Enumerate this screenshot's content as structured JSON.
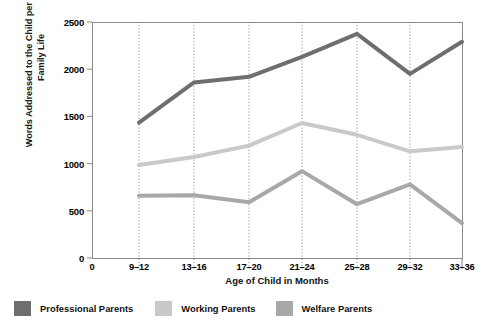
{
  "chart_data": {
    "type": "line",
    "title": "",
    "xlabel": "Age of Child in Months",
    "ylabel": "Words Addressed to the Child per Hour of Family Life",
    "categories": [
      "9–12",
      "13–16",
      "17–20",
      "21–24",
      "25–28",
      "29–32",
      "33–36"
    ],
    "xtick_labels": [
      "0",
      "9–12",
      "13–16",
      "17–20",
      "21–24",
      "25–28",
      "29–32",
      "33–36"
    ],
    "ytick_labels": [
      "0",
      "500",
      "1000",
      "1500",
      "2000",
      "2500"
    ],
    "yticks": [
      0,
      500,
      1000,
      1500,
      2000,
      2500
    ],
    "ylim": [
      0,
      2500
    ],
    "grid": "vertical-dotted",
    "legend_position": "bottom",
    "series": [
      {
        "name": "Professional Parents",
        "color": "#6e6e6e",
        "values": [
          1435,
          1860,
          1920,
          2130,
          2375,
          1950,
          2290
        ]
      },
      {
        "name": "Working Parents",
        "color": "#c9c9c9",
        "values": [
          985,
          1070,
          1190,
          1430,
          1305,
          1130,
          1175
        ]
      },
      {
        "name": "Welfare Parents",
        "color": "#a8a8a8",
        "values": [
          660,
          665,
          590,
          920,
          570,
          780,
          370
        ]
      }
    ]
  },
  "colors": {
    "professional": "#6e6e6e",
    "working": "#c9c9c9",
    "welfare": "#a8a8a8",
    "axis": "#8a8a8a",
    "grid": "#777777",
    "text": "#111111",
    "background": "#ffffff"
  }
}
